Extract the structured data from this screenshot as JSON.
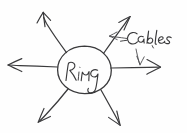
{
  "figure": {
    "kind": "hand-drawn-sketch",
    "medium": "pen-on-paper",
    "background_color": "#fefefe",
    "ink_color": "#3a3a3c",
    "width": 187,
    "height": 133
  },
  "nodes": [
    {
      "id": "ring",
      "label": "Ring",
      "shape": "ellipse",
      "center": [
        84,
        70
      ],
      "radius_x": 27,
      "radius_y": 24,
      "label_style": "cursive-handwriting"
    }
  ],
  "annotations": [
    {
      "id": "cables",
      "label": "Cables",
      "style": "cursive-handwriting",
      "position": [
        124,
        42
      ],
      "leader_arrows": [
        {
          "id": "cables-leader-up",
          "from": [
            128,
            38
          ],
          "to": [
            110,
            36
          ],
          "target": "upper-right-cable"
        },
        {
          "id": "cables-leader-down",
          "from": [
            137,
            48
          ],
          "to": [
            140,
            63
          ],
          "target": "right-cable"
        }
      ]
    }
  ],
  "cables": [
    {
      "id": "upper-left-cable",
      "direction": "upper-left",
      "from": [
        66,
        52
      ],
      "to": [
        43,
        12
      ]
    },
    {
      "id": "upper-right-cable",
      "direction": "upper-right",
      "to": [
        130,
        17
      ],
      "from": [
        103,
        53
      ]
    },
    {
      "id": "left-cable",
      "direction": "left",
      "from": [
        57,
        67
      ],
      "to": [
        8,
        65
      ]
    },
    {
      "id": "right-cable",
      "direction": "right",
      "from": [
        111,
        68
      ],
      "to": [
        160,
        67
      ]
    },
    {
      "id": "lower-left-cable",
      "direction": "lower-left",
      "from": [
        68,
        89
      ],
      "to": [
        38,
        122
      ]
    },
    {
      "id": "lower-right-cable",
      "direction": "lower-right",
      "from": [
        101,
        90
      ],
      "to": [
        120,
        125
      ]
    }
  ],
  "counts": {
    "cable_count": 6,
    "node_count": 1,
    "annotation_count": 1
  }
}
